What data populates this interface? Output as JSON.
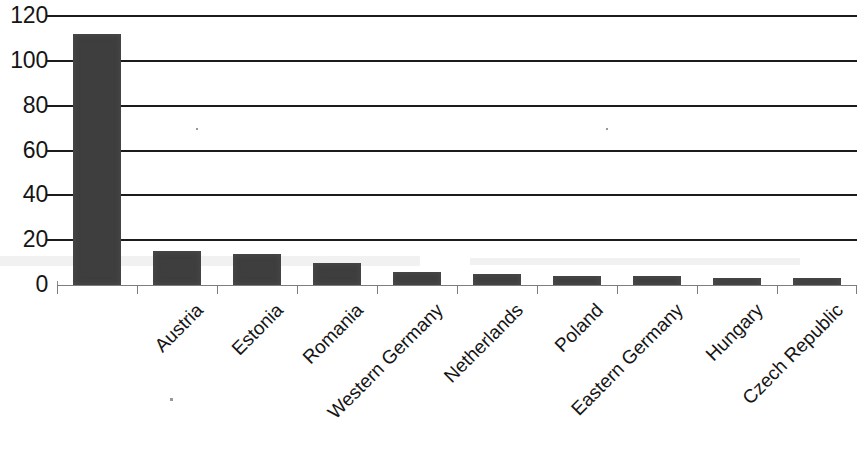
{
  "chart_data": {
    "type": "bar",
    "title": "",
    "subtitle": "",
    "xlabel": "",
    "ylabel": "",
    "categories": [
      "Austria",
      "Estonia",
      "Romania",
      "Western Germany",
      "Netherlands",
      "Poland",
      "Eastern Germany",
      "Hungary",
      "Czech Republic",
      "Bulgaria"
    ],
    "values": [
      112,
      15,
      14,
      10,
      6,
      5,
      4,
      4,
      3,
      3
    ],
    "ylim": [
      0,
      120
    ],
    "yticks": [
      0,
      20,
      40,
      60,
      80,
      100,
      120
    ],
    "ytick_labels": [
      "0",
      "20",
      "40",
      "60",
      "80",
      "100",
      "120"
    ],
    "grid": true,
    "grid_axis": "y",
    "legend": false,
    "legend_position": "none",
    "bar_color": "#3e3e3e",
    "grid_color": "#1b1b1b",
    "axis_color": "#7d7d7d",
    "text_color": "#141414",
    "background_color": "#ffffff",
    "x_label_rotation": -45
  }
}
